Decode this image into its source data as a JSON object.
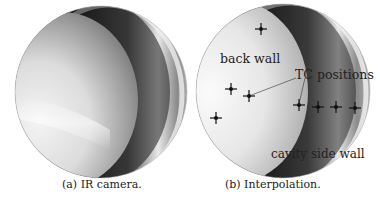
{
  "figure": {
    "panels": [
      {
        "id": "a",
        "caption": "(a) IR camera."
      },
      {
        "id": "b",
        "caption": "(b) Interpolation.",
        "annotations": {
          "back_wall": "back wall",
          "tc_positions": "TC positions",
          "cavity_side_wall": "cavity side wall"
        },
        "tc_markers": [
          {
            "x": 261,
            "y": 29
          },
          {
            "x": 231,
            "y": 89
          },
          {
            "x": 249,
            "y": 96
          },
          {
            "x": 216,
            "y": 118
          },
          {
            "x": 299,
            "y": 105
          },
          {
            "x": 318,
            "y": 107
          },
          {
            "x": 336,
            "y": 107
          },
          {
            "x": 355,
            "y": 108
          }
        ]
      }
    ]
  }
}
